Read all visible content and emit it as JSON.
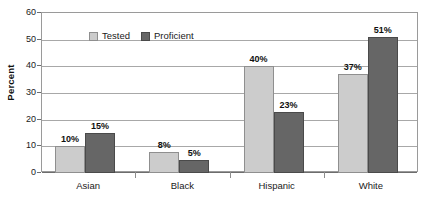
{
  "chart_data": {
    "type": "bar",
    "title": "",
    "xlabel": "",
    "ylabel": "Percent",
    "ylim": [
      0,
      60
    ],
    "ytick_step": 10,
    "yticks": [
      0,
      10,
      20,
      30,
      40,
      50,
      60
    ],
    "ytick_labels": [
      "0",
      "10",
      "20",
      "30",
      "40",
      "50",
      "60"
    ],
    "grid": true,
    "legend_position": "top-left-inside",
    "categories": [
      "Asian",
      "Black",
      "Hispanic",
      "White"
    ],
    "series": [
      {
        "name": "Tested",
        "color": "#cccccc",
        "values": [
          10,
          8,
          40,
          37
        ],
        "labels": [
          "10%",
          "8%",
          "40%",
          "37%"
        ]
      },
      {
        "name": "Proficient",
        "color": "#666666",
        "values": [
          15,
          5,
          23,
          51
        ],
        "labels": [
          "15%",
          "5%",
          "23%",
          "51%"
        ]
      }
    ]
  },
  "legend": {
    "items": [
      {
        "label": "Tested",
        "swatch": "tested"
      },
      {
        "label": "Proficient",
        "swatch": "proficient"
      }
    ]
  },
  "axis": {
    "y_title": "Percent"
  }
}
